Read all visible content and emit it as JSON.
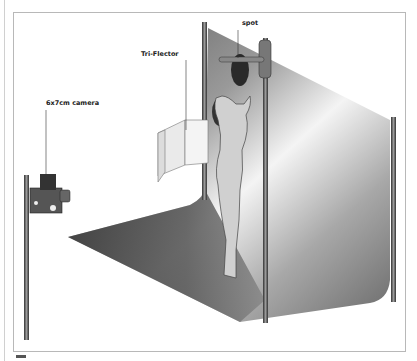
{
  "diagram": {
    "type": "studio lighting setup",
    "labels": {
      "spot": "spot",
      "reflector": "Tri-Flector",
      "camera": "6x7cm camera"
    },
    "elements": [
      "camera on stand",
      "Tri-Flector reflector",
      "model",
      "spot light on boom",
      "curved backdrop sweep",
      "backdrop poles"
    ]
  }
}
